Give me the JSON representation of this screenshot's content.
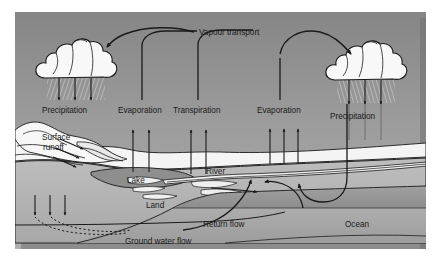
{
  "diagram": {
    "title_text": "Vapour transport",
    "labels": {
      "vapour_transport": "Vapour transport",
      "precipitation_left": "Precipitation",
      "evaporation_left": "Evaporation",
      "transpiration": "Transpiration",
      "evaporation_right": "Evaporation",
      "precipitation_right": "Precipitation",
      "surface_runoff_line1": "Surface",
      "surface_runoff_line2": "runoff",
      "river": "River",
      "lake": "Lake",
      "land": "Land",
      "ocean": "Ocean",
      "return_flow": "Return flow",
      "ground_water_flow": "Ground water flow"
    },
    "colors": {
      "sky_top": "#8c8c8c",
      "sky_bottom": "#ababab",
      "terrain_light": "#f2f2f2",
      "land": "#b5b5b5",
      "land_dark": "#a3a3a3",
      "lake": "#8e8e8e",
      "ocean_upper": "#9a9a9a",
      "ocean_lower": "#8f8f8f",
      "cloud": "#f7f7f7",
      "stroke": "#1a1a1a",
      "page_background": "#ffffff",
      "frame_shadow": "#6f6f6f"
    },
    "icons": {
      "cloud_left": "cloud-icon",
      "cloud_right": "cloud-icon",
      "rain_left": "rain-icon",
      "rain_right": "rain-icon"
    },
    "flow_arrows": {
      "evaporation_left_count": 2,
      "transpiration_count": 2,
      "evaporation_right_count": 3,
      "precipitation_left_count": 3,
      "precipitation_right_count": 3,
      "surface_runoff_count": 3,
      "infiltration_count": 3,
      "return_flow_count": 2
    }
  }
}
